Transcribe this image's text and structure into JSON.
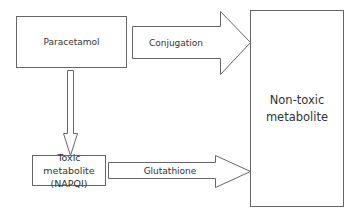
{
  "diagram": {
    "colors": {
      "stroke": "#666666",
      "fill": "#ffffff",
      "text": "#333333"
    },
    "nodes": [
      {
        "id": "paracetamol",
        "label": "Paracetamol"
      },
      {
        "id": "toxic",
        "label": "Toxic metabolite (NAPQI)",
        "line1": "Toxic metabolite",
        "line2": "(NAPQI)"
      },
      {
        "id": "nontoxic",
        "label": "Non-toxic metabolite",
        "line1": "Non-toxic",
        "line2": "metabolite"
      }
    ],
    "edges": [
      {
        "from": "paracetamol",
        "to": "nontoxic",
        "label": "Conjugation"
      },
      {
        "from": "paracetamol",
        "to": "toxic",
        "label": ""
      },
      {
        "from": "toxic",
        "to": "nontoxic",
        "label": "Glutathione"
      }
    ]
  }
}
